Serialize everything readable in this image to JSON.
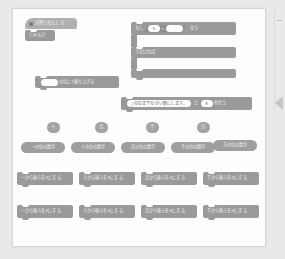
{
  "app": {
    "title": "ブロックプログラミング ワークスペース",
    "canvas_background": "#fdfdfd",
    "page_background": "#e9e9e9",
    "block_color": "#9a9a9a",
    "hat_color": "#b0b0b0",
    "slot_color": "#fbfbfb"
  },
  "scripts": {
    "hat_block": {
      "icon": "green-flag-icon",
      "label": "が押されたとき"
    },
    "say_block": {
      "label": "じゃんけ"
    },
    "carry_block": {
      "prefix": "",
      "slot_value": "",
      "label": "の位に1繰り上げる"
    },
    "if_block": {
      "label_if": "もし",
      "operand_left": "4",
      "operator": "=",
      "operand_right": "",
      "label_then": "なら",
      "label_else": "でなければ"
    },
    "round_block": {
      "slot_text": "○の位までのがい数にします。",
      "connector": "と",
      "seconds": "5",
      "suffix": "秒言う"
    }
  },
  "palette": {
    "place_chips": [
      {
        "label": "十"
      },
      {
        "label": "百"
      },
      {
        "label": "千"
      },
      {
        "label": "万"
      }
    ],
    "digit_reporters": [
      {
        "label": "一の位の数字"
      },
      {
        "label": "十の位の数字"
      },
      {
        "label": "百の位の数字"
      },
      {
        "label": "千の位の数字"
      },
      {
        "label": "万の位の数字"
      }
    ],
    "zero_blocks_row1": [
      {
        "label": "一から後ろを0にする"
      },
      {
        "label": "十から後ろを0にする"
      },
      {
        "label": "百から後ろを0にする"
      },
      {
        "label": "千から後ろを0にする"
      }
    ],
    "zero_blocks_row2": [
      {
        "label": "一から後ろを0にする"
      },
      {
        "label": "十から後ろを0にする"
      },
      {
        "label": "百から後ろを0にする"
      },
      {
        "label": "千から後ろを0にする"
      }
    ]
  }
}
